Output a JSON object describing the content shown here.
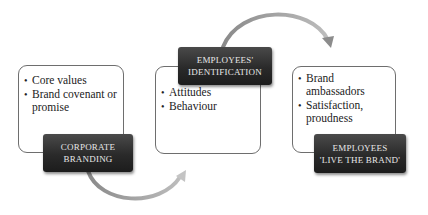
{
  "diagram": {
    "type": "process-flow",
    "stages": [
      {
        "label_lines": [
          "CORPORATE",
          "BRANDING"
        ],
        "bullets": [
          "Core values",
          "Brand covenant or promise"
        ]
      },
      {
        "label_lines": [
          "EMPLOYEES'",
          "IDENTIFICATION"
        ],
        "bullets": [
          "Attitudes",
          "Behaviour"
        ]
      },
      {
        "label_lines": [
          "EMPLOYEES",
          "'LIVE THE BRAND'"
        ],
        "bullets": [
          "Brand ambassadors",
          "Satisfaction, proudness"
        ]
      }
    ],
    "connectors": [
      {
        "from": "CORPORATE BRANDING",
        "to": "EMPLOYEES' IDENTIFICATION",
        "shape": "curved-arrow-below"
      },
      {
        "from": "EMPLOYEES' IDENTIFICATION",
        "to": "EMPLOYEES 'LIVE THE BRAND'",
        "shape": "curved-arrow-above"
      }
    ],
    "colors": {
      "label_bg": "#2a2a2a",
      "label_text": "#e8e8e8",
      "box_border": "#6e6e6e",
      "arrow": "#9a9a9a"
    }
  }
}
